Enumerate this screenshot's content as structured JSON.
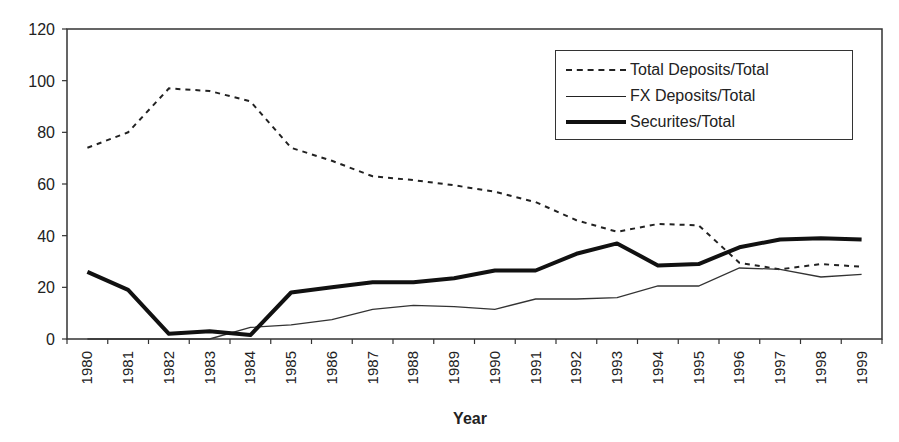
{
  "chart_data": {
    "type": "line",
    "title": "",
    "xlabel": "Year",
    "ylabel": "",
    "ylim": [
      0,
      120
    ],
    "yticks": [
      0,
      20,
      40,
      60,
      80,
      100,
      120
    ],
    "grid": false,
    "legend_position": "upper right (inside)",
    "categories": [
      "1980",
      "1981",
      "1982",
      "1983",
      "1984",
      "1985",
      "1986",
      "1987",
      "1988",
      "1989",
      "1990",
      "1991",
      "1992",
      "1993",
      "1994",
      "1995",
      "1996",
      "1997",
      "1998",
      "1999"
    ],
    "series": [
      {
        "name": "Total  Deposits/Total",
        "style": "dashed",
        "values": [
          74,
          80,
          97,
          96,
          92,
          74,
          69,
          63,
          61.5,
          59.5,
          57,
          53,
          46,
          41.5,
          44.5,
          44,
          29.5,
          27,
          29,
          28
        ]
      },
      {
        "name": "FX Deposits/Total",
        "style": "thin",
        "values": [
          0,
          0,
          0,
          0,
          4.5,
          5.5,
          7.5,
          11.5,
          13,
          12.5,
          11.5,
          15.5,
          15.5,
          16,
          20.5,
          20.5,
          27.5,
          27,
          24,
          25
        ]
      },
      {
        "name": "Securites/Total",
        "style": "thick",
        "values": [
          26,
          19,
          2,
          3,
          1.5,
          18,
          20,
          22,
          22,
          23.5,
          26.5,
          26.5,
          33,
          37,
          28.5,
          29,
          35.5,
          38.5,
          39,
          38.5
        ]
      }
    ]
  },
  "legend": {
    "items": [
      {
        "label": "Total  Deposits/Total"
      },
      {
        "label": "FX Deposits/Total"
      },
      {
        "label": "Securites/Total"
      }
    ]
  },
  "axes": {
    "xlabel": "Year"
  }
}
